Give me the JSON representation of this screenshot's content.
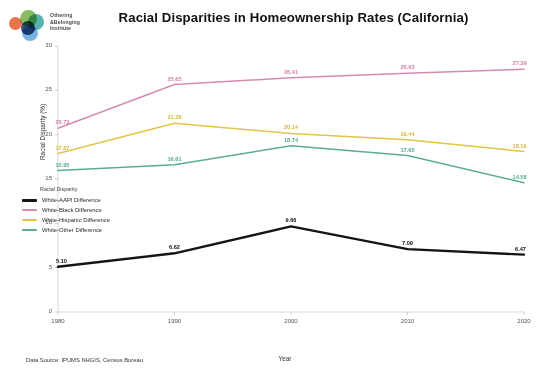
{
  "logo": {
    "name": "Othering & Belonging Institute",
    "line1": "Othering",
    "line2": "&Belonging",
    "line3": "Institute"
  },
  "header": {
    "title": "Racial Disparities in Homeownership Rates (California)"
  },
  "footer": {
    "source": "Data Source: IPUMS NHGIS, Census Bureau"
  },
  "chart_data": {
    "type": "line",
    "title": "Racial Disparities in Homeownership Rates (California)",
    "xlabel": "Year",
    "ylabel": "Racial Disparity (%)",
    "categories": [
      "1980",
      "1990",
      "2000",
      "2010",
      "2020"
    ],
    "x": [
      1980,
      1990,
      2000,
      2010,
      2020
    ],
    "xlim": [
      1980,
      2020
    ],
    "ylim": [
      0,
      30
    ],
    "yticks": [
      0,
      5,
      10,
      15,
      20,
      25,
      30
    ],
    "ytick_labels": [
      "0",
      "5",
      "10",
      "15",
      "20",
      "25",
      "30"
    ],
    "grid": false,
    "legend_title": "Racial Disparity",
    "legend_position": "center-left",
    "series": [
      {
        "name": "White-AAPI Difference",
        "color": "#141414",
        "values": [
          5.1,
          6.62,
          9.66,
          7.09,
          6.47
        ],
        "labels": [
          "5.10",
          "6.62",
          "9.66",
          "7.09",
          "6.47"
        ]
      },
      {
        "name": "White-Black Difference",
        "color": "#d48bb0",
        "values": [
          20.73,
          25.65,
          26.41,
          26.93,
          27.39
        ],
        "labels": [
          "20.73",
          "25.65",
          "26.41",
          "26.93",
          "27.39"
        ]
      },
      {
        "name": "White-Hispanic Difference",
        "color": "#e3c44a",
        "values": [
          17.87,
          21.28,
          20.14,
          19.44,
          18.1
        ],
        "labels": [
          "17.87",
          "21.28",
          "20.14",
          "19.44",
          "18.10"
        ]
      },
      {
        "name": "White-Other Difference",
        "color": "#5cab97",
        "values": [
          15.95,
          16.61,
          18.74,
          17.65,
          14.58
        ],
        "labels": [
          "15.95",
          "16.61",
          "18.74",
          "17.65",
          "14.58"
        ]
      }
    ]
  }
}
